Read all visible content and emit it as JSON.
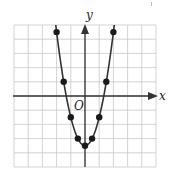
{
  "chart_data": {
    "type": "scatter",
    "title": "",
    "xlabel": "x",
    "ylabel": "y",
    "origin_label": "O",
    "function": "y = 2x^2 - 3.5",
    "xlim": [
      -5,
      5
    ],
    "ylim": [
      -5,
      5
    ],
    "grid": true,
    "grid_step": 1,
    "tick_labels": false,
    "legend": null,
    "series": [
      {
        "name": "parabola",
        "style": "points-with-smooth-curve",
        "x": [
          -2,
          -1.5,
          -1,
          -0.5,
          0,
          0.5,
          1,
          1.5,
          2
        ],
        "y": [
          4.5,
          1,
          -1.5,
          -3,
          -3.5,
          -3,
          -1.5,
          1,
          4.5
        ]
      }
    ]
  },
  "colors": {
    "grid": "#c8c8c8",
    "axis": "#333333",
    "curve": "#333333",
    "point": "#1a1a1a",
    "background": "#ffffff"
  }
}
